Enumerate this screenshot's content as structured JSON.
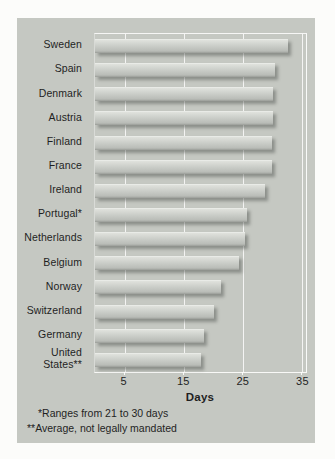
{
  "colors": {
    "page_bg": "#fcfcfa",
    "card_bg": "#c5c8c2",
    "gridline": "#ffffff",
    "bar_light": "#e0e2dd",
    "bar_mid": "#cdd0cb",
    "bar_dark": "#9a9d98",
    "text": "#1f1f1f"
  },
  "chart_data": {
    "type": "bar",
    "orientation": "horizontal",
    "title": "",
    "categories": [
      "Sweden",
      "Spain",
      "Denmark",
      "Austria",
      "Finland",
      "France",
      "Ireland",
      "Portugal*",
      "Netherlands",
      "Belgium",
      "Norway",
      "Switzerland",
      "Germany",
      "United States**"
    ],
    "values": [
      32.5,
      30.3,
      30.1,
      30.0,
      29.9,
      29.8,
      28.6,
      25.6,
      25.3,
      24.3,
      21.2,
      20.0,
      18.4,
      17.8
    ],
    "xlabel": "Days",
    "ylabel": "",
    "xticks": [
      5,
      15,
      25,
      35
    ],
    "xlim": [
      0,
      35.6
    ],
    "grid": "vertical white gridlines at x ticks, drawn behind bars",
    "legend_position": "none",
    "footnotes": [
      "*Ranges from 21 to 30 days",
      "**Average, not legally mandated"
    ]
  }
}
